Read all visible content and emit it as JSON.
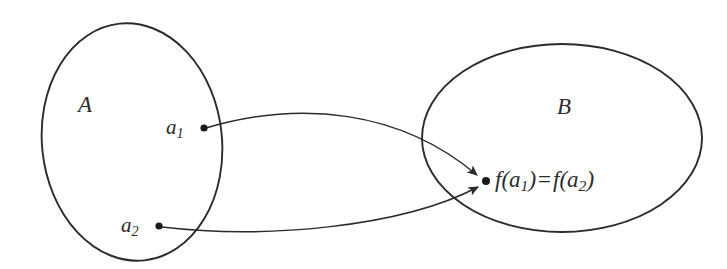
{
  "figure": {
    "type": "set-mapping-diagram",
    "background_color": "#ffffff",
    "stroke_color": "#2b2b2b",
    "text_color": "#2b2b2b",
    "width": 727,
    "height": 269
  },
  "sets": {
    "domain": {
      "name": "domain-set",
      "label": "A",
      "shape": "ellipse",
      "center_x": 132,
      "center_y": 142,
      "radius_x": 90,
      "radius_y": 119,
      "rotation": -6,
      "label_x": 85,
      "label_y": 105
    },
    "codomain": {
      "name": "codomain-set",
      "label": "B",
      "shape": "ellipse",
      "center_x": 562,
      "center_y": 138,
      "radius_x": 140,
      "radius_y": 94,
      "rotation": 0,
      "label_x": 565,
      "label_y": 107
    }
  },
  "points": [
    {
      "id": "a1",
      "name": "point-a1",
      "label_main": "a",
      "label_sub": "1",
      "x": 204,
      "y": 128,
      "label_x": 168,
      "label_y": 128,
      "set": "A"
    },
    {
      "id": "a2",
      "name": "point-a2",
      "label_main": "a",
      "label_sub": "2",
      "x": 159,
      "y": 226,
      "label_x": 123,
      "label_y": 226,
      "set": "A"
    },
    {
      "id": "fa",
      "name": "point-image",
      "label_main": "f(a",
      "label_sub": "1",
      "label_mid": ") = f(a",
      "label_sub2": "2",
      "label_end": ")",
      "x": 486,
      "y": 181,
      "label_x": 497,
      "label_y": 181,
      "set": "B"
    }
  ],
  "image_label": {
    "full_text": "f(a1) = f(a2)",
    "f_symbol": "f",
    "open_paren": "(",
    "arg1": "a",
    "sub1": "1",
    "close_paren": ")",
    "equals": "=",
    "arg2": "a",
    "sub2": "2"
  },
  "arrows": [
    {
      "id": "arrow-a1",
      "name": "mapping-arrow-a1",
      "from": "a1",
      "to": "fa",
      "path": "M 206 128 C 300 100 400 110 478 176",
      "arrowhead": "solid-triangle"
    },
    {
      "id": "arrow-a2",
      "name": "mapping-arrow-a2",
      "from": "a2",
      "to": "fa",
      "path": "M 162 227 C 260 238 400 226 479 186",
      "arrowhead": "solid-triangle"
    }
  ]
}
